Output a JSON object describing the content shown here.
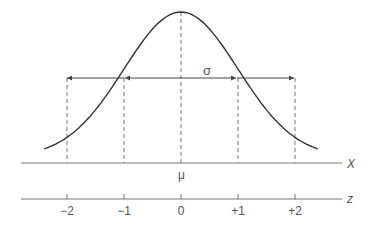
{
  "diagram": {
    "curve": "normal-bell-curve",
    "sigma_label": "σ",
    "mu_label": "μ",
    "x_axis_label": "X",
    "z_axis_label": "z",
    "z_ticks": [
      {
        "value": -2,
        "label": "−2"
      },
      {
        "value": -1,
        "label": "−1"
      },
      {
        "value": 0,
        "label": "0"
      },
      {
        "value": 1,
        "label": "+1"
      },
      {
        "value": 2,
        "label": "+2"
      }
    ],
    "colors": {
      "curve": "#333333",
      "axis": "#666666",
      "dashed": "#777777",
      "text": "#555555"
    }
  }
}
